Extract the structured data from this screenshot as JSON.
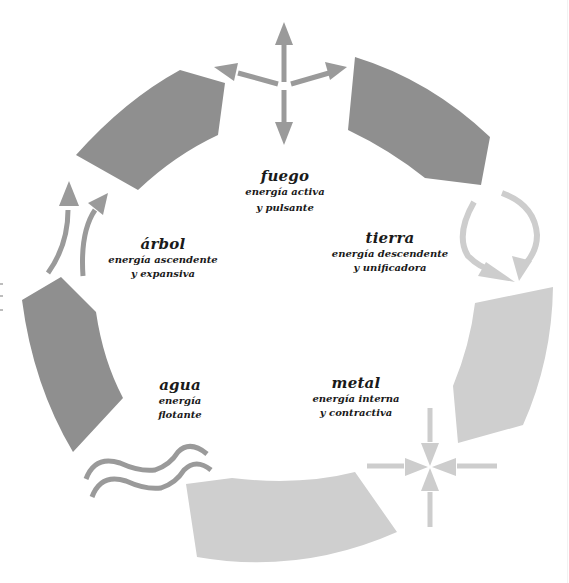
{
  "diagram": {
    "colors": {
      "dark_segment": "#8f8f8f",
      "light_segment": "#cfcfcf",
      "dark_arrow": "#9a9a9a",
      "light_arrow": "#cdcdcd",
      "text": "#1a1a1a",
      "background": "#ffffff"
    },
    "elements": [
      {
        "id": "fuego",
        "name": "fuego",
        "line1": "energía activa",
        "line2": "y pulsante",
        "segment_tone": "dark",
        "symbol": "outward-arrows-icon"
      },
      {
        "id": "tierra",
        "name": "tierra",
        "line1": "energía descendente",
        "line2": "y unificadora",
        "segment_tone": "light",
        "symbol": "circular-down-arrows-icon"
      },
      {
        "id": "metal",
        "name": "metal",
        "line1": "energía interna",
        "line2": "y contractiva",
        "segment_tone": "light",
        "symbol": "inward-arrows-icon"
      },
      {
        "id": "agua",
        "name": "agua",
        "line1": "energía",
        "line2": "flotante",
        "segment_tone": "dark",
        "symbol": "wave-icon"
      },
      {
        "id": "arbol",
        "name": "árbol",
        "line1": "energía ascendente",
        "line2": "y expansiva",
        "segment_tone": "dark",
        "symbol": "upward-curved-arrows-icon"
      }
    ]
  }
}
